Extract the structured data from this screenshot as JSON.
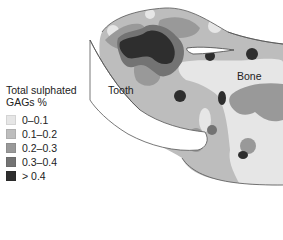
{
  "figure": {
    "labels": {
      "tooth": "Tooth",
      "bone": "Bone"
    }
  },
  "legend": {
    "title_line1": "Total sulphated",
    "title_line2": "GAGs %",
    "items": [
      {
        "label": "0–0.1",
        "color": "#e6e6e6"
      },
      {
        "label": "0.1–0.2",
        "color": "#bdbdbd"
      },
      {
        "label": "0.2–0.3",
        "color": "#999999"
      },
      {
        "label": "0.3–0.4",
        "color": "#737373"
      },
      {
        "label": "> 0.4",
        "color": "#2e2e2e"
      }
    ]
  },
  "colors": {
    "level0": "#e6e6e6",
    "level1": "#bdbdbd",
    "level2": "#999999",
    "level3": "#737373",
    "level4": "#2e2e2e",
    "outline": "#555555",
    "tooth_fill": "#ffffff"
  }
}
